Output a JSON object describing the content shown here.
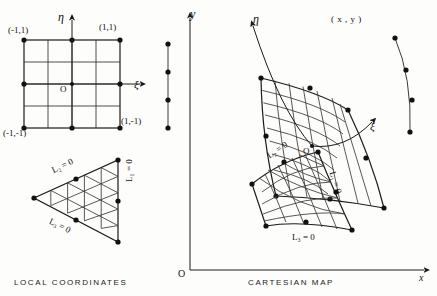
{
  "figure": {
    "title_left": "LOCAL   COORDINATES",
    "title_right": "CARTESIAN   MAP",
    "axes": {
      "y_label": "y",
      "x_label": "x",
      "origin_label": "O"
    },
    "local": {
      "square": {
        "eta_label": "η",
        "xi_label": "ξ",
        "origin_label": "O",
        "corner_top_left": "(-1,1)",
        "corner_top_right": "(1,1)",
        "corner_bottom_left": "(-1,-1)",
        "corner_bottom_right": "(1,-1)",
        "grid_divisions": 4,
        "node_count": 8
      },
      "triangle": {
        "edge_label_1": "L₁ = 0",
        "edge_label_2": "L₂ = 0",
        "edge_label_3": "L₃ = 0",
        "grid_divisions": 5
      },
      "line": {
        "node_count": 4
      }
    },
    "cartesian": {
      "quad": {
        "eta_label": "η",
        "xi_label": "ξ",
        "origin_label": "O",
        "point_label": "( x , y )",
        "grid_divisions": 5
      },
      "triangle": {
        "edge_label_1": "L₁ = 0",
        "edge_label_2": "L₂ = 0",
        "edge_label_3": "L₃ = 0",
        "grid_divisions": 5
      },
      "curve": {
        "node_count": 4
      }
    },
    "colors": {
      "ink": "#1a1a1a",
      "grid": "#3a3a3a",
      "background": "#fdfdfb"
    }
  }
}
